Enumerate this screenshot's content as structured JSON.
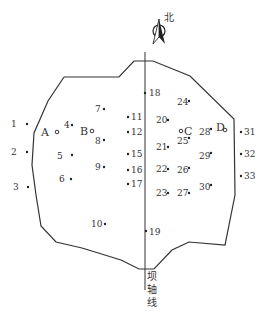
{
  "north": {
    "label": "北"
  },
  "axis": {
    "label": [
      "坝",
      "轴",
      "线"
    ]
  },
  "points": [
    {
      "id": "1",
      "x": 27,
      "y": 124
    },
    {
      "id": "2",
      "x": 27,
      "y": 152
    },
    {
      "id": "3",
      "x": 28,
      "y": 187
    },
    {
      "id": "4",
      "x": 72,
      "y": 125
    },
    {
      "id": "5",
      "x": 72,
      "y": 155
    },
    {
      "id": "6",
      "x": 71,
      "y": 179
    },
    {
      "id": "7",
      "x": 104,
      "y": 109
    },
    {
      "id": "8",
      "x": 104,
      "y": 140
    },
    {
      "id": "9",
      "x": 104,
      "y": 167
    },
    {
      "id": "10",
      "x": 105,
      "y": 224
    },
    {
      "id": "11",
      "x": 128,
      "y": 117
    },
    {
      "id": "12",
      "x": 128,
      "y": 132
    },
    {
      "id": "15",
      "x": 128,
      "y": 154
    },
    {
      "id": "16",
      "x": 128,
      "y": 170
    },
    {
      "id": "17",
      "x": 128,
      "y": 184
    },
    {
      "id": "18",
      "x": 145,
      "y": 93
    },
    {
      "id": "19",
      "x": 146,
      "y": 231
    },
    {
      "id": "20",
      "x": 168,
      "y": 120
    },
    {
      "id": "21",
      "x": 168,
      "y": 147
    },
    {
      "id": "22",
      "x": 168,
      "y": 169
    },
    {
      "id": "23",
      "x": 168,
      "y": 193
    },
    {
      "id": "24",
      "x": 189,
      "y": 101
    },
    {
      "id": "25",
      "x": 189,
      "y": 138
    },
    {
      "id": "26",
      "x": 189,
      "y": 168
    },
    {
      "id": "27",
      "x": 189,
      "y": 193
    },
    {
      "id": "28",
      "x": 211,
      "y": 129
    },
    {
      "id": "29",
      "x": 211,
      "y": 153
    },
    {
      "id": "30",
      "x": 211,
      "y": 185
    },
    {
      "id": "31",
      "x": 241,
      "y": 132
    },
    {
      "id": "32",
      "x": 241,
      "y": 154
    },
    {
      "id": "33",
      "x": 241,
      "y": 176
    }
  ],
  "stations": [
    {
      "id": "A",
      "x": 57,
      "y": 132
    },
    {
      "id": "B",
      "x": 92,
      "y": 131
    },
    {
      "id": "C",
      "x": 181,
      "y": 131
    },
    {
      "id": "D",
      "x": 225,
      "y": 130
    }
  ],
  "labels": {
    "p1": "1",
    "p2": "2",
    "p3": "3",
    "p4": "4",
    "p5": "5",
    "p6": "6",
    "p7": "7",
    "p8": "8",
    "p9": "9",
    "p10": "10",
    "p11": "11",
    "p12": "12",
    "p15": "15",
    "p16": "16",
    "p17": "17",
    "p18": "18",
    "p19": "19",
    "p20": "20",
    "p21": "21",
    "p22": "22",
    "p23": "23",
    "p24": "24",
    "p25": "25",
    "p26": "26",
    "p27": "27",
    "p28": "28",
    "p29": "29",
    "p30": "30",
    "p31": "31",
    "p32": "32",
    "p33": "33",
    "A": "A",
    "B": "B",
    "C": "C",
    "D": "D"
  }
}
